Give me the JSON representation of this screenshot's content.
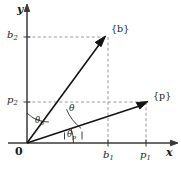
{
  "figure": {
    "background_color": "#ffffff",
    "line_color": "#1a1a1a",
    "dash_color": "#8c8c8c",
    "axes": {
      "x_label": "x",
      "y_label": "y",
      "origin_label": "0"
    },
    "ticks": {
      "x": [
        {
          "label": "b",
          "sub": "1",
          "value_x": 108
        },
        {
          "label": "p",
          "sub": "1",
          "value_x": 146
        }
      ],
      "y": [
        {
          "label": "b",
          "sub": "2",
          "value_y": 37
        },
        {
          "label": "p",
          "sub": "2",
          "value_y": 102
        }
      ]
    },
    "vectors": [
      {
        "name": "b",
        "label": "{b}",
        "tip_x": 105,
        "tip_y": 37
      },
      {
        "name": "p",
        "label": "{p}",
        "tip_x": 148,
        "tip_y": 102
      }
    ],
    "angles": [
      {
        "name": "theta",
        "label": "θ",
        "sub": ""
      },
      {
        "name": "theta_b",
        "label": "θ",
        "sub": "b"
      },
      {
        "name": "theta_p",
        "label": "θ",
        "sub": "p"
      }
    ]
  }
}
